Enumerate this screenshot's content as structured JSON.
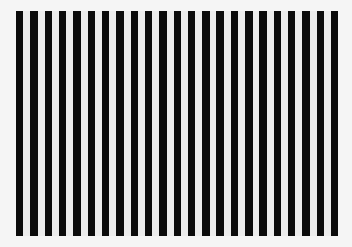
{
  "image": {
    "description": "Vertical black and white bar grating pattern",
    "width": 352,
    "height": 247,
    "background_color": "#f5f5f5"
  },
  "grating": {
    "left": 16,
    "top": 11,
    "bottom": 236,
    "stripe_count": 23,
    "period": 14.32,
    "stripe_width": 7.4,
    "stripe_color": "#0b0b0b",
    "gap_color": "#ececec"
  }
}
